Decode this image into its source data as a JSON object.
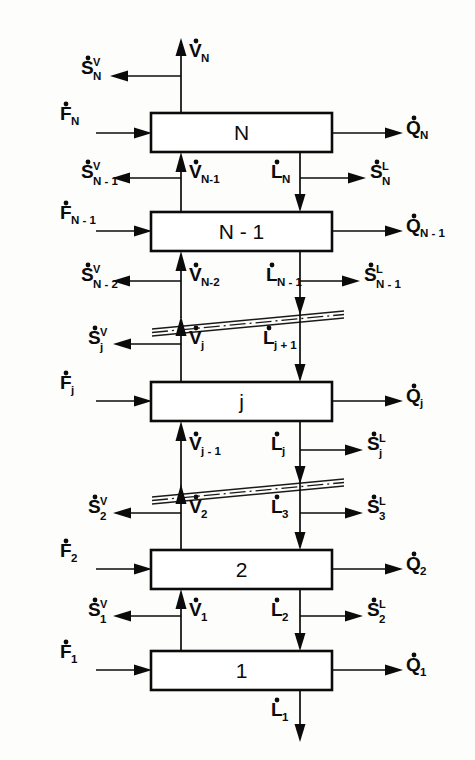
{
  "diagram": {
    "type": "process-flow-diagram",
    "ink_color": "#0b0b0b",
    "background_color": "#fdfdfc",
    "stages": [
      {
        "id": "N",
        "label": "N"
      },
      {
        "id": "N-1",
        "label": "N - 1"
      },
      {
        "id": "j",
        "label": "j"
      },
      {
        "id": "2",
        "label": "2"
      },
      {
        "id": "1",
        "label": "1"
      }
    ],
    "breaks": [
      {
        "id": "break-upper",
        "style": "dash-dot-double-slant"
      },
      {
        "id": "break-lower",
        "style": "dash-dot-double-slant"
      }
    ],
    "labels": {
      "v_top": {
        "base": "V",
        "sub": "N",
        "sup": "",
        "dot": true
      },
      "s_v_N": {
        "base": "S",
        "sub": "N",
        "sup": "V",
        "dot": true
      },
      "f_N": {
        "base": "F",
        "sub": "N",
        "sup": "",
        "dot": true
      },
      "q_N": {
        "base": "Q",
        "sub": "N",
        "sup": "",
        "dot": true
      },
      "s_v_Nm1": {
        "base": "S",
        "sub": "N - 1",
        "sup": "V",
        "dot": true
      },
      "v_Nm1": {
        "base": "V",
        "sub": "N-1",
        "sup": "",
        "dot": true
      },
      "l_N": {
        "base": "L",
        "sub": "N",
        "sup": "",
        "dot": true
      },
      "s_l_N": {
        "base": "S",
        "sub": "N",
        "sup": "L",
        "dot": true
      },
      "f_Nm1": {
        "base": "F",
        "sub": "N - 1",
        "sup": "",
        "dot": true
      },
      "q_Nm1": {
        "base": "Q",
        "sub": "N - 1",
        "sup": "",
        "dot": true
      },
      "s_v_Nm2": {
        "base": "S",
        "sub": "N - 2",
        "sup": "V",
        "dot": true
      },
      "v_Nm2": {
        "base": "V",
        "sub": "N-2",
        "sup": "",
        "dot": true
      },
      "l_Nm1": {
        "base": "L",
        "sub": "N - 1",
        "sup": "",
        "dot": true
      },
      "s_l_Nm1": {
        "base": "S",
        "sub": "N - 1",
        "sup": "L",
        "dot": true
      },
      "s_v_j": {
        "base": "S",
        "sub": "j",
        "sup": "V",
        "dot": true
      },
      "v_j": {
        "base": "V",
        "sub": "j",
        "sup": "",
        "dot": true
      },
      "l_jp1": {
        "base": "L",
        "sub": "j + 1",
        "sup": "",
        "dot": true
      },
      "f_j": {
        "base": "F",
        "sub": "j",
        "sup": "",
        "dot": true
      },
      "q_j": {
        "base": "Q",
        "sub": "j",
        "sup": "",
        "dot": true
      },
      "v_jm1": {
        "base": "V",
        "sub": "j - 1",
        "sup": "",
        "dot": true
      },
      "l_j": {
        "base": "L",
        "sub": "j",
        "sup": "",
        "dot": true
      },
      "s_l_j": {
        "base": "S",
        "sub": "j",
        "sup": "L",
        "dot": true
      },
      "s_v_2": {
        "base": "S",
        "sub": "2",
        "sup": "V",
        "dot": true
      },
      "v_2": {
        "base": "V",
        "sub": "2",
        "sup": "",
        "dot": true
      },
      "l_3": {
        "base": "L",
        "sub": "3",
        "sup": "",
        "dot": true
      },
      "s_l_3": {
        "base": "S",
        "sub": "3",
        "sup": "L",
        "dot": true
      },
      "f_2": {
        "base": "F",
        "sub": "2",
        "sup": "",
        "dot": true
      },
      "q_2": {
        "base": "Q",
        "sub": "2",
        "sup": "",
        "dot": true
      },
      "s_v_1": {
        "base": "S",
        "sub": "1",
        "sup": "V",
        "dot": true
      },
      "v_1": {
        "base": "V",
        "sub": "1",
        "sup": "",
        "dot": true
      },
      "l_2": {
        "base": "L",
        "sub": "2",
        "sup": "",
        "dot": true
      },
      "s_l_2": {
        "base": "S",
        "sub": "2",
        "sup": "L",
        "dot": true
      },
      "f_1": {
        "base": "F",
        "sub": "1",
        "sup": "",
        "dot": true
      },
      "q_1": {
        "base": "Q",
        "sub": "1",
        "sup": "",
        "dot": true
      },
      "l_1": {
        "base": "L",
        "sub": "1",
        "sup": "",
        "dot": true
      }
    }
  }
}
